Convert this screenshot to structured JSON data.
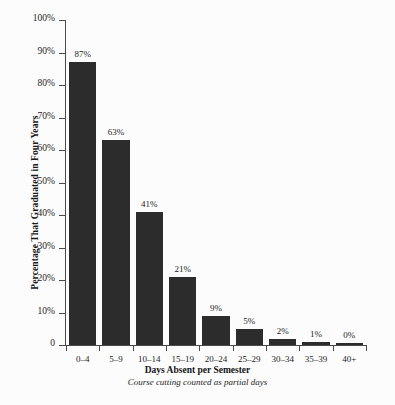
{
  "chart_data": {
    "type": "bar",
    "title": "",
    "xlabel": "Days Absent per Semester",
    "xsublabel": "Course cutting counted as partial days",
    "ylabel": "Percentage That Graduated in Four Years",
    "categories": [
      "0–4",
      "5–9",
      "10–14",
      "15–19",
      "20–24",
      "25–29",
      "30–34",
      "35–39",
      "40+"
    ],
    "values": [
      87,
      63,
      41,
      21,
      9,
      5,
      2,
      1,
      0
    ],
    "value_labels": [
      "87%",
      "63%",
      "41%",
      "21%",
      "9%",
      "5%",
      "2%",
      "1%",
      "0%"
    ],
    "ylim": [
      0,
      100
    ],
    "ytick_values": [
      0,
      10,
      20,
      30,
      40,
      50,
      60,
      70,
      80,
      90,
      100
    ],
    "ytick_labels": [
      "0",
      "10%",
      "20%",
      "30%",
      "40%",
      "50%",
      "60%",
      "70%",
      "80%",
      "90%",
      "100%"
    ],
    "grid": false,
    "legend": false,
    "bar_color": "#2c2c2c",
    "axis_color": "#4a4a4a",
    "background_color": "#fcfcfc"
  }
}
